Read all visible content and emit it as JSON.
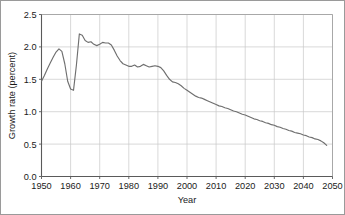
{
  "chart_data": {
    "type": "line",
    "title": "",
    "xlabel": "Year",
    "ylabel": "Growth rate (percent)",
    "xlim": [
      1950,
      2050
    ],
    "ylim": [
      0.0,
      2.5
    ],
    "grid": true,
    "legend": "none",
    "x_ticks": [
      "1950",
      "1960",
      "1970",
      "1980",
      "1990",
      "2000",
      "2010",
      "2020",
      "2030",
      "2040",
      "2050"
    ],
    "y_ticks": [
      "0.0",
      "0.5",
      "1.0",
      "1.5",
      "2.0",
      "2.5"
    ],
    "x_tick_values": [
      1950,
      1960,
      1970,
      1980,
      1990,
      2000,
      2010,
      2020,
      2030,
      2040,
      2050
    ],
    "y_tick_values": [
      0.0,
      0.5,
      1.0,
      1.5,
      2.0,
      2.5
    ],
    "line_color": "#6f6f6f",
    "grid_color": "#c8c8c8",
    "series": [
      {
        "name": "Growth rate",
        "x": [
          1950,
          1951,
          1952,
          1953,
          1954,
          1955,
          1956,
          1957,
          1958,
          1959,
          1960,
          1961,
          1962,
          1963,
          1964,
          1965,
          1966,
          1967,
          1968,
          1969,
          1970,
          1971,
          1972,
          1973,
          1974,
          1975,
          1976,
          1977,
          1978,
          1979,
          1980,
          1981,
          1982,
          1983,
          1984,
          1985,
          1986,
          1987,
          1988,
          1989,
          1990,
          1991,
          1992,
          1993,
          1994,
          1995,
          1996,
          1997,
          1998,
          1999,
          2000,
          2001,
          2002,
          2003,
          2004,
          2005,
          2006,
          2007,
          2008,
          2009,
          2010,
          2011,
          2012,
          2013,
          2014,
          2015,
          2016,
          2017,
          2018,
          2019,
          2020,
          2021,
          2022,
          2023,
          2024,
          2025,
          2026,
          2027,
          2028,
          2029,
          2030,
          2031,
          2032,
          2033,
          2034,
          2035,
          2036,
          2037,
          2038,
          2039,
          2040,
          2041,
          2042,
          2043,
          2044,
          2045,
          2046,
          2047,
          2048
        ],
        "values": [
          1.47,
          1.56,
          1.66,
          1.75,
          1.84,
          1.92,
          1.97,
          1.93,
          1.74,
          1.47,
          1.35,
          1.33,
          1.72,
          2.2,
          2.18,
          2.1,
          2.07,
          2.08,
          2.04,
          2.02,
          2.04,
          2.07,
          2.06,
          2.06,
          2.03,
          1.95,
          1.86,
          1.79,
          1.74,
          1.72,
          1.7,
          1.7,
          1.72,
          1.69,
          1.7,
          1.73,
          1.71,
          1.69,
          1.7,
          1.71,
          1.7,
          1.68,
          1.63,
          1.56,
          1.5,
          1.46,
          1.45,
          1.43,
          1.4,
          1.36,
          1.33,
          1.3,
          1.27,
          1.24,
          1.22,
          1.21,
          1.19,
          1.17,
          1.15,
          1.13,
          1.11,
          1.09,
          1.08,
          1.06,
          1.05,
          1.03,
          1.01,
          1.0,
          0.98,
          0.96,
          0.95,
          0.93,
          0.91,
          0.89,
          0.88,
          0.86,
          0.85,
          0.83,
          0.82,
          0.8,
          0.79,
          0.77,
          0.76,
          0.74,
          0.73,
          0.71,
          0.7,
          0.68,
          0.67,
          0.66,
          0.64,
          0.63,
          0.61,
          0.6,
          0.58,
          0.57,
          0.55,
          0.52,
          0.48
        ]
      }
    ]
  }
}
